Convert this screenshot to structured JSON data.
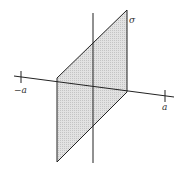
{
  "diagram": {
    "title": "",
    "colors": {
      "line": "#222222",
      "plane_fill": "#d9d9d9",
      "background": "#ffffff"
    },
    "labels": {
      "plane": "σ",
      "neg_tick": "−a",
      "pos_tick": "a"
    },
    "elements": [
      {
        "type": "axis",
        "name": "vertical-axis"
      },
      {
        "type": "axis",
        "name": "horizontal-axis",
        "ticks": [
          "−a",
          "a"
        ]
      },
      {
        "type": "plane",
        "name": "sigma-plane",
        "label": "σ"
      }
    ]
  }
}
